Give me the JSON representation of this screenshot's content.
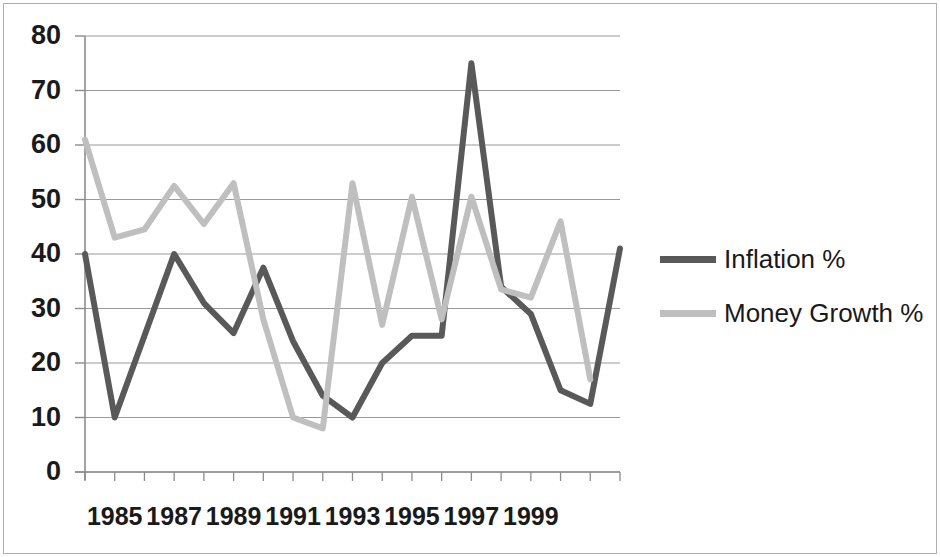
{
  "chart_data": {
    "type": "line",
    "title": "",
    "xlabel": "",
    "ylabel": "",
    "ylim": [
      0,
      80
    ],
    "ytick_step": 10,
    "yticks": [
      0,
      10,
      20,
      30,
      40,
      50,
      60,
      70,
      80
    ],
    "grid": true,
    "legend_position": "right",
    "x": [
      1984,
      1985,
      1986,
      1987,
      1988,
      1989,
      1990,
      1991,
      1992,
      1993,
      1994,
      1995,
      1996,
      1997,
      1998,
      1999,
      2000,
      2001,
      2002
    ],
    "xtick_labels": [
      "1985",
      "1987",
      "1989",
      "1991",
      "1993",
      "1995",
      "1997",
      "1999"
    ],
    "xtick_values": [
      1985,
      1987,
      1989,
      1991,
      1993,
      1995,
      1997,
      1999
    ],
    "series": [
      {
        "name": "Inflation %",
        "color": "#595959",
        "values": [
          40,
          10,
          25,
          40,
          31,
          25.5,
          37.5,
          24,
          14,
          10,
          20,
          25,
          25,
          75,
          34,
          29,
          15,
          12.5,
          41
        ]
      },
      {
        "name": "Money Growth %",
        "color": "#bfbfbf",
        "values": [
          61,
          43,
          44.5,
          52.5,
          45.5,
          53,
          28,
          10,
          8,
          53,
          27,
          50.5,
          28,
          50.5,
          33.5,
          32,
          46,
          17,
          null
        ]
      }
    ]
  },
  "legend": {
    "items": [
      {
        "label": "Inflation %",
        "color": "#595959"
      },
      {
        "label": "Money Growth %",
        "color": "#bfbfbf"
      }
    ]
  },
  "axis": {
    "y_labels": [
      "80",
      "70",
      "60",
      "50",
      "40",
      "30",
      "20",
      "10",
      "0"
    ],
    "x_labels": [
      "1985",
      "1987",
      "1989",
      "1991",
      "1993",
      "1995",
      "1997",
      "1999"
    ]
  }
}
